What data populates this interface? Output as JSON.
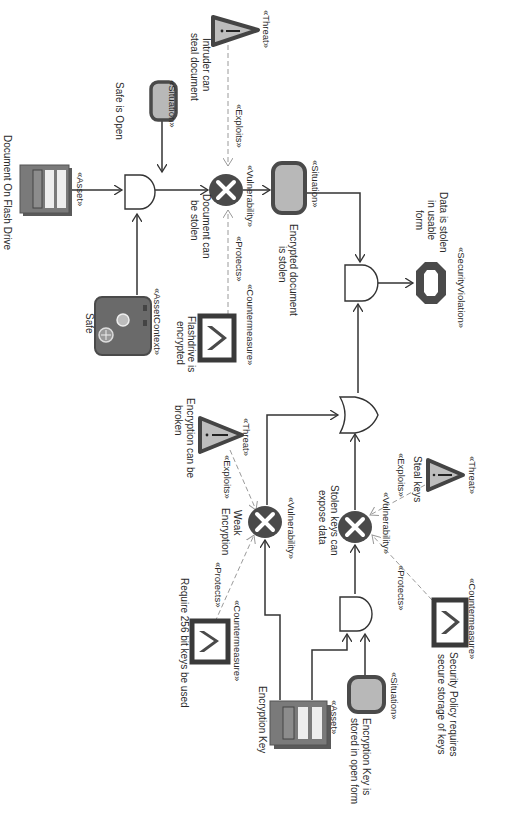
{
  "diagram": {
    "orientation": "rotated-90-clockwise",
    "colors": {
      "line": "#333333",
      "dashed_line": "#9a9a9a",
      "node_dark": "#4a4a4a",
      "node_fill": "#b5b5b5",
      "node_light": "#e8e8e8",
      "background": "#ffffff"
    },
    "nodes": {
      "threat_intruder": {
        "stereotype": "«Threat»",
        "label_l1": "Intruder can",
        "label_l2": "steal document"
      },
      "situation_safe_open": {
        "stereotype": "«Situation»",
        "label": "Safe is Open"
      },
      "asset_document": {
        "stereotype": "«Asset»",
        "label": "Document On Flash Drive"
      },
      "asset_context_safe": {
        "stereotype": "«AssetContext»",
        "label": "Safe"
      },
      "vuln_document_stolen": {
        "stereotype": "«Vulnerability»",
        "label_l1": "Document can",
        "label_l2": "be stolen"
      },
      "countermeasure_flashdrive": {
        "stereotype": "«Countermeasure»",
        "label_l1": "Flashdrive is",
        "label_l2": "encrypted"
      },
      "situation_encrypted_stolen": {
        "stereotype": "«Situation»",
        "label_l1": "Encrypted document",
        "label_l2": "is stolen"
      },
      "security_violation": {
        "stereotype": "«SecurityViolation»",
        "label_l1": "Data is stolen",
        "label_l2": "in usable",
        "label_l3": "form"
      },
      "threat_steal_keys": {
        "stereotype": "«Threat»",
        "label": "Steal keys"
      },
      "vuln_stolen_keys": {
        "stereotype": "«Vulnerability»",
        "label_l1": "Stolen keys can",
        "label_l2": "expose data"
      },
      "countermeasure_policy": {
        "stereotype": "«Countermeasure»",
        "label_l1": "Security Policy requires",
        "label_l2": "secure storage of keys"
      },
      "threat_encryption_broken": {
        "stereotype": "«Threat»",
        "label_l1": "Encryption can be",
        "label_l2": "broken"
      },
      "vuln_weak_encryption": {
        "stereotype": "«Vulnerability»",
        "label_l1": "Weak",
        "label_l2": "Encryption"
      },
      "countermeasure_256": {
        "stereotype": "«Countermeasure»",
        "label": "Require 256 bit keys be used"
      },
      "asset_encryption_key": {
        "stereotype": "«Asset»",
        "label": "Encryption Key"
      },
      "situation_key_open": {
        "stereotype": "«Situation»",
        "label_l1": "Encryption Key is",
        "label_l2": "stored in open form"
      }
    },
    "edge_labels": {
      "exploits_1": "«Exploits»",
      "protects_1": "«Protects»",
      "exploits_2": "«Exploits»",
      "protects_2": "«Protects»",
      "exploits_3": "«Exploits»",
      "protects_3": "«Protects»"
    },
    "gates": [
      "AND",
      "AND",
      "OR",
      "AND"
    ]
  }
}
